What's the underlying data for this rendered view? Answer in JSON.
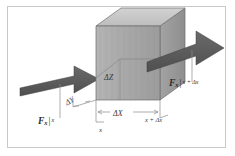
{
  "figure": {
    "type": "diagram",
    "border_color": "#c9c9c9",
    "background": "#ffffff"
  },
  "labels": {
    "force_left": {
      "symbol": "F",
      "subscript": "x",
      "bar": "|",
      "evaluated_at": "x"
    },
    "force_right": {
      "symbol": "F",
      "subscript": "x",
      "bar": "|",
      "evaluated_at": "x + Δx"
    },
    "delta_z": "ΔZ",
    "delta_x": "ΔX",
    "delta_y": "ΔY",
    "axis_x": "x",
    "axis_x_plus": "x + Δx"
  },
  "colors": {
    "arrow": "#5e5e5e",
    "arrow_dark": "#4a4a4a",
    "cube_front": "#a9a9a9",
    "cube_top": "#c6c6c6",
    "cube_side": "#9a9a9a",
    "cube_edge": "#6b6b6b",
    "leader_line": "#8c8c8c",
    "text": "#2b2b2b"
  },
  "geometry": {
    "cube": {
      "front_face": "96,26 96,100 160,100 160,26",
      "top_face": "96,26 121,8 185,8 160,26",
      "right_face": "160,26 185,8 185,82 160,100"
    },
    "arrow_in": {
      "direction": "right",
      "from": "x-face"
    },
    "arrow_out": {
      "direction": "right",
      "to": "x+dx-face"
    }
  }
}
